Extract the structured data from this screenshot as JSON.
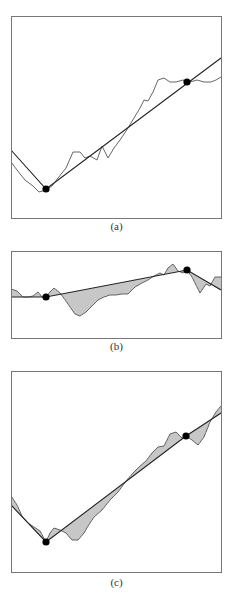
{
  "figure": {
    "panels": [
      {
        "id": "a",
        "caption": "(a)",
        "box": {
          "x": 11,
          "y": 16,
          "w": 210,
          "h": 202
        },
        "signal": [
          [
            11,
            162
          ],
          [
            17,
            170
          ],
          [
            25,
            180
          ],
          [
            33,
            186
          ],
          [
            39,
            192
          ],
          [
            46,
            190
          ],
          [
            52,
            186
          ],
          [
            58,
            178
          ],
          [
            66,
            168
          ],
          [
            73,
            152
          ],
          [
            80,
            152
          ],
          [
            85,
            158
          ],
          [
            90,
            156
          ],
          [
            97,
            160
          ],
          [
            102,
            146
          ],
          [
            108,
            158
          ],
          [
            114,
            148
          ],
          [
            120,
            140
          ],
          [
            128,
            128
          ],
          [
            134,
            118
          ],
          [
            140,
            108
          ],
          [
            144,
            100
          ],
          [
            148,
            101
          ],
          [
            153,
            92
          ],
          [
            158,
            80
          ],
          [
            164,
            78
          ],
          [
            170,
            82
          ],
          [
            176,
            82
          ],
          [
            183,
            80
          ],
          [
            190,
            82
          ],
          [
            197,
            80
          ],
          [
            204,
            82
          ],
          [
            211,
            82
          ],
          [
            216,
            80
          ],
          [
            221,
            77
          ]
        ],
        "fit_line": [
          [
            11,
            150
          ],
          [
            46,
            189
          ],
          [
            221,
            58
          ]
        ],
        "breakpoints": [
          [
            46,
            189
          ],
          [
            187,
            82
          ]
        ],
        "hatched": false
      },
      {
        "id": "b",
        "caption": "(b)",
        "box": {
          "x": 11,
          "y": 251,
          "w": 210,
          "h": 87
        },
        "signal": [
          [
            11,
            289
          ],
          [
            17,
            291
          ],
          [
            23,
            297
          ],
          [
            28,
            297
          ],
          [
            33,
            296
          ],
          [
            38,
            292
          ],
          [
            42,
            297
          ],
          [
            46,
            297
          ],
          [
            50,
            292
          ],
          [
            54,
            288
          ],
          [
            60,
            293
          ],
          [
            66,
            301
          ],
          [
            70,
            307
          ],
          [
            75,
            314
          ],
          [
            80,
            316
          ],
          [
            86,
            312
          ],
          [
            92,
            306
          ],
          [
            98,
            300
          ],
          [
            104,
            297
          ],
          [
            110,
            295
          ],
          [
            116,
            295
          ],
          [
            122,
            294
          ],
          [
            128,
            294
          ],
          [
            135,
            287
          ],
          [
            142,
            283
          ],
          [
            148,
            280
          ],
          [
            154,
            276
          ],
          [
            160,
            273
          ],
          [
            164,
            275
          ],
          [
            168,
            268
          ],
          [
            173,
            264
          ],
          [
            178,
            271
          ],
          [
            183,
            273
          ],
          [
            187,
            270
          ],
          [
            192,
            277
          ],
          [
            196,
            285
          ],
          [
            200,
            293
          ],
          [
            206,
            284
          ],
          [
            210,
            286
          ],
          [
            215,
            277
          ],
          [
            221,
            277
          ]
        ],
        "fit_line": [
          [
            11,
            297
          ],
          [
            46,
            297
          ],
          [
            187,
            270
          ],
          [
            221,
            290
          ]
        ],
        "breakpoints": [
          [
            46,
            297
          ],
          [
            187,
            270
          ]
        ],
        "hatched": true
      },
      {
        "id": "c",
        "caption": "(c)",
        "box": {
          "x": 11,
          "y": 371,
          "w": 210,
          "h": 201
        },
        "signal": [
          [
            11,
            496
          ],
          [
            17,
            505
          ],
          [
            22,
            516
          ],
          [
            28,
            523
          ],
          [
            34,
            527
          ],
          [
            40,
            531
          ],
          [
            46,
            542
          ],
          [
            50,
            533
          ],
          [
            54,
            528
          ],
          [
            60,
            530
          ],
          [
            66,
            533
          ],
          [
            72,
            540
          ],
          [
            78,
            540
          ],
          [
            84,
            533
          ],
          [
            88,
            526
          ],
          [
            94,
            517
          ],
          [
            102,
            510
          ],
          [
            110,
            500
          ],
          [
            118,
            492
          ],
          [
            126,
            481
          ],
          [
            134,
            472
          ],
          [
            140,
            466
          ],
          [
            146,
            461
          ],
          [
            152,
            453
          ],
          [
            158,
            447
          ],
          [
            164,
            446
          ],
          [
            170,
            434
          ],
          [
            176,
            432
          ],
          [
            182,
            438
          ],
          [
            186,
            436
          ],
          [
            192,
            440
          ],
          [
            198,
            445
          ],
          [
            204,
            437
          ],
          [
            210,
            422
          ],
          [
            216,
            412
          ],
          [
            221,
            406
          ]
        ],
        "fit_line": [
          [
            11,
            505
          ],
          [
            46,
            542
          ],
          [
            186,
            436
          ],
          [
            221,
            413
          ]
        ],
        "breakpoints": [
          [
            46,
            542
          ],
          [
            186,
            436
          ]
        ],
        "hatched": true
      }
    ]
  },
  "colors": {
    "frame": "#777777",
    "signal": "#555555",
    "fit_line": "#222222",
    "hatch": "#444444",
    "dot": "#000000"
  }
}
